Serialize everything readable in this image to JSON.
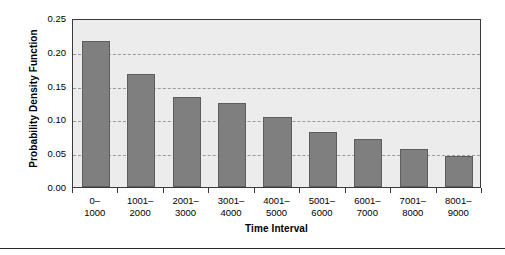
{
  "chart_data": {
    "type": "bar",
    "title": "",
    "xlabel": "Time Interval",
    "ylabel": "Probability Density Function",
    "categories": [
      "0–\n1000",
      "1001–\n2000",
      "2001–\n3000",
      "3001–\n4000",
      "4001–\n5000",
      "5001–\n6000",
      "6001–\n7000",
      "7001–\n8000",
      "8001–\n9000"
    ],
    "category_lines": [
      [
        "0–",
        "1000"
      ],
      [
        "1001–",
        "2000"
      ],
      [
        "2001–",
        "3000"
      ],
      [
        "3001–",
        "4000"
      ],
      [
        "4001–",
        "5000"
      ],
      [
        "5001–",
        "6000"
      ],
      [
        "6001–",
        "7000"
      ],
      [
        "7001–",
        "8000"
      ],
      [
        "8001–",
        "9000"
      ]
    ],
    "values": [
      0.216,
      0.167,
      0.133,
      0.124,
      0.104,
      0.081,
      0.071,
      0.056,
      0.046
    ],
    "ylim": [
      0.0,
      0.25
    ],
    "ytick_labels": [
      "0.00",
      "0.05",
      "0.10",
      "0.15",
      "0.20",
      "0.25"
    ],
    "ytick_values": [
      0.0,
      0.05,
      0.1,
      0.15,
      0.2,
      0.25
    ],
    "grid": true,
    "legend": false,
    "bar_color": "#7f7f7f",
    "bar_edge_color": "#5d5d5d",
    "plot_background": "#ececec",
    "gridline_color": "#9a9a9a",
    "axis_color": "#3a3a3a"
  }
}
